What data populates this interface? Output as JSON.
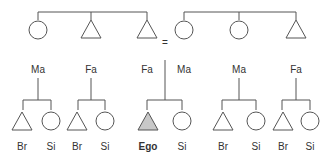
{
  "diagram": {
    "colors": {
      "line": "#555555",
      "ego_fill": "#c8c8c8",
      "text": "#333333"
    },
    "marriage_symbol": "=",
    "parents": [
      {
        "id": "p1",
        "label": "Ma",
        "shape": "circle",
        "x": 38
      },
      {
        "id": "p2",
        "label": "Fa",
        "shape": "triangle",
        "x": 91
      },
      {
        "id": "p3",
        "label": "Fa",
        "shape": "triangle",
        "x": 147
      },
      {
        "id": "p4",
        "label": "Ma",
        "shape": "circle",
        "x": 184
      },
      {
        "id": "p5",
        "label": "Ma",
        "shape": "circle",
        "x": 239
      },
      {
        "id": "p6",
        "label": "Fa",
        "shape": "triangle",
        "x": 296
      }
    ],
    "children": [
      {
        "label": "Br",
        "shape": "triangle",
        "x": 22
      },
      {
        "label": "Si",
        "shape": "circle",
        "x": 51
      },
      {
        "label": "Br",
        "shape": "triangle",
        "x": 77
      },
      {
        "label": "Si",
        "shape": "circle",
        "x": 105
      },
      {
        "label": "Ego",
        "shape": "triangle",
        "x": 148,
        "ego": true
      },
      {
        "label": "Si",
        "shape": "circle",
        "x": 182
      },
      {
        "label": "Br",
        "shape": "triangle",
        "x": 223
      },
      {
        "label": "Si",
        "shape": "circle",
        "x": 256
      },
      {
        "label": "Br",
        "shape": "triangle",
        "x": 283
      },
      {
        "label": "Si",
        "shape": "circle",
        "x": 310
      }
    ]
  }
}
